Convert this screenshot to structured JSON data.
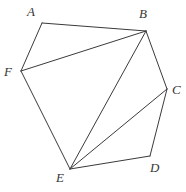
{
  "figure": {
    "name": "hexagon-with-diagonals",
    "canvas": {
      "width": 186,
      "height": 192
    },
    "background_color": "#ffffff",
    "stroke_color": "#3a3a3a",
    "stroke_width": 1,
    "label_color": "#363636",
    "vertices": [
      {
        "id": "A",
        "label": "A",
        "x": 42,
        "y": 23,
        "label_x": 27,
        "label_y": 5
      },
      {
        "id": "B",
        "label": "B",
        "x": 146,
        "y": 31,
        "label_x": 139,
        "label_y": 7
      },
      {
        "id": "C",
        "label": "C",
        "x": 167,
        "y": 89,
        "label_x": 172,
        "label_y": 83
      },
      {
        "id": "D",
        "label": "D",
        "x": 150,
        "y": 156,
        "label_x": 150,
        "label_y": 161
      },
      {
        "id": "E",
        "label": "E",
        "x": 70,
        "y": 169,
        "label_x": 56,
        "label_y": 171
      },
      {
        "id": "F",
        "label": "F",
        "x": 21,
        "y": 71,
        "label_x": 4,
        "label_y": 65
      }
    ],
    "perimeter_edges": [
      {
        "name": "edge-AB",
        "from": "A",
        "to": "B"
      },
      {
        "name": "edge-BC",
        "from": "B",
        "to": "C"
      },
      {
        "name": "edge-CD",
        "from": "C",
        "to": "D"
      },
      {
        "name": "edge-DE",
        "from": "D",
        "to": "E"
      },
      {
        "name": "edge-EF",
        "from": "E",
        "to": "F"
      },
      {
        "name": "edge-FA",
        "from": "F",
        "to": "A"
      }
    ],
    "diagonal_edges": [
      {
        "name": "diagonal-BF",
        "from": "B",
        "to": "F"
      },
      {
        "name": "diagonal-BE",
        "from": "B",
        "to": "E"
      },
      {
        "name": "diagonal-CE",
        "from": "C",
        "to": "E"
      }
    ]
  }
}
